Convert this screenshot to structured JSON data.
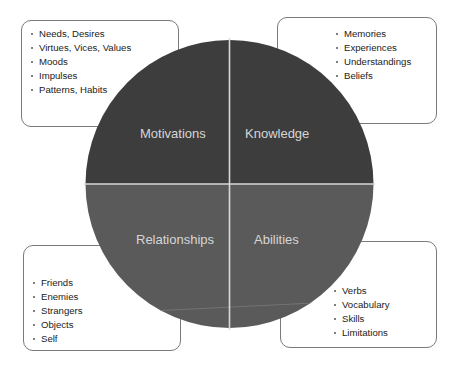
{
  "diagram": {
    "type": "quadrant-circle-with-callouts",
    "colors": {
      "top_half": "#3d3d3d",
      "bottom_half": "#5a5a5a",
      "divider": "#d9d9d9",
      "label_text": "#d6d6d6",
      "callout_border": "#7a7a7a",
      "callout_text": "#222222"
    },
    "quadrants": [
      {
        "id": "motivations",
        "label": "Motivations",
        "position": "top-left",
        "items": [
          "Needs, Desires",
          "Virtues, Vices, Values",
          "Moods",
          "Impulses",
          "Patterns, Habits"
        ]
      },
      {
        "id": "knowledge",
        "label": "Knowledge",
        "position": "top-right",
        "items": [
          "Memories",
          "Experiences",
          "Understandings",
          "Beliefs"
        ]
      },
      {
        "id": "relationships",
        "label": "Relationships",
        "position": "bottom-left",
        "items": [
          "Friends",
          "Enemies",
          "Strangers",
          "Objects",
          "Self"
        ]
      },
      {
        "id": "abilities",
        "label": "Abilities",
        "position": "bottom-right",
        "items": [
          "Verbs",
          "Vocabulary",
          "Skills",
          "Limitations"
        ]
      }
    ]
  }
}
